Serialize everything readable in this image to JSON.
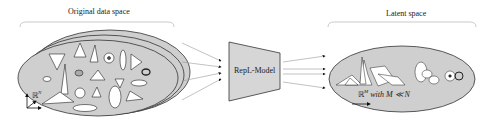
{
  "labels": {
    "original_space": "Original data space",
    "latent_space": "Latent space",
    "model": "RepL-Model",
    "original_dim": "ℝ",
    "original_dim_sup": "N",
    "latent_dim": "ℝ",
    "latent_dim_sup": "M",
    "latent_dim_suffix": " with M ≪ N"
  },
  "colors": {
    "ellipse_fill": "#cfcfcf",
    "ellipse_stroke": "#333333",
    "model_fill": "#d6d6d6",
    "arrow": "#999999",
    "bracket": "#bbbbbb",
    "shape_fill": "#ffffff"
  }
}
